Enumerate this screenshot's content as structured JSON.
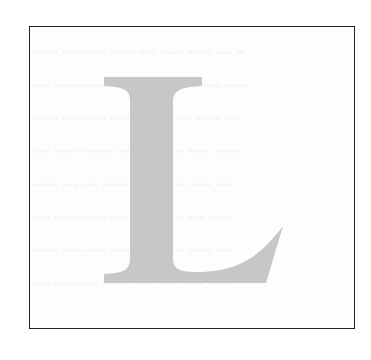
{
  "figure": {
    "letter": "L",
    "letter_color": "#c7c7c7",
    "border_color": "#222222",
    "background": "#ffffff",
    "bleed_through_lines": [
      "~~~ ~~~ ~~ ~~~ ~~ ~~~ ~~~ ~~ ~",
      "~~ ~~~~ ~~~ ~~ ~~~~ ~~~ ~~ ~~~",
      "~~~ ~~ ~~~ ~~~~ ~~ ~~~ ~~~ ~~",
      "~~ ~~~ ~~~~ ~~ ~~~ ~~ ~~~ ~~~",
      "~~~ ~~ ~~ ~~~ ~~~~ ~~ ~~~ ~~",
      "~~ ~~~ ~~~ ~~ ~~ ~~~~ ~~ ~~~",
      "~~~ ~~ ~~~ ~~~ ~~ ~~~ ~~~ ~~",
      "~~ ~~~ ~~ ~~~ ~~~ ~~ ~~~ ~~~"
    ]
  }
}
